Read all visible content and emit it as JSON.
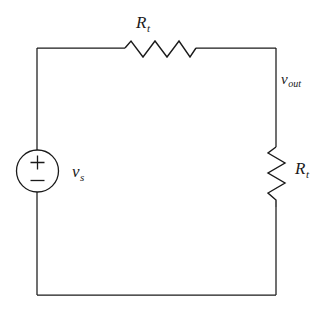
{
  "diagram": {
    "type": "electrical-circuit-schematic",
    "background_color": "#ffffff",
    "line_color": "#1a1a1a",
    "width": 334,
    "height": 310
  },
  "labels": {
    "resistor_top": {
      "symbol": "R",
      "subscript": "t"
    },
    "resistor_right": {
      "symbol": "R",
      "subscript": "t"
    },
    "source": {
      "symbol": "v",
      "subscript": "s"
    },
    "output_node": {
      "symbol": "v",
      "subscript": "out"
    }
  },
  "source": {
    "plus_sign": "+",
    "minus_sign": "−",
    "shape": "circle"
  },
  "components": [
    {
      "name": "voltage-source",
      "kind": "independent-voltage-source",
      "label": "v_s",
      "orientation": "vertical",
      "position": "left-branch"
    },
    {
      "name": "resistor-top",
      "kind": "resistor",
      "label": "R_t",
      "orientation": "horizontal",
      "position": "top-branch"
    },
    {
      "name": "resistor-right",
      "kind": "resistor",
      "label": "R_t",
      "orientation": "vertical",
      "position": "right-branch"
    }
  ],
  "nodes": [
    {
      "name": "v_out",
      "label": "v_out",
      "position": "top-right"
    }
  ]
}
